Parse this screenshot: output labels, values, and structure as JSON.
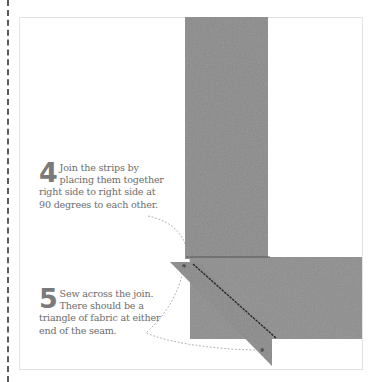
{
  "steps": [
    {
      "number": "4",
      "text": "Join the strips by placing them together right side to right side at 90 degrees to each other."
    },
    {
      "number": "5",
      "text": "Sew across the join. There should be a triangle of fabric at either end of the seam."
    }
  ],
  "colors": {
    "fabric": "#8c8c8c",
    "fabric_dark": "#7d7d7d",
    "text": "#6d6d6d",
    "leader_line": "#9a9a9a",
    "stitch": "#2a2a2a"
  }
}
